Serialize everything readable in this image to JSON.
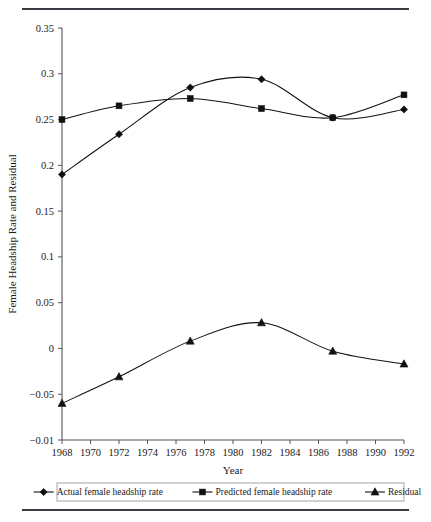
{
  "figure": {
    "top_rule": "horizontal-rule",
    "bottom_rule": "horizontal-rule"
  },
  "chart_data": {
    "type": "line",
    "title": "",
    "xlabel": "Year",
    "ylabel": "Female Headship Rate and Residual",
    "x": [
      1968,
      1972,
      1977,
      1982,
      1987,
      1992
    ],
    "xlim": [
      1968,
      1992
    ],
    "ylim": [
      -0.1,
      0.35
    ],
    "grid": false,
    "legend_position": "bottom",
    "xticks": [
      1968,
      1970,
      1972,
      1974,
      1976,
      1978,
      1980,
      1982,
      1984,
      1986,
      1988,
      1990,
      1992
    ],
    "xticklabels": [
      "1968",
      "1970",
      "1972",
      "1974",
      "1976",
      "1978",
      "1980",
      "1982",
      "1984",
      "1986",
      "1988",
      "1990",
      "1992"
    ],
    "yticks": [
      0.35,
      0.3,
      0.25,
      0.2,
      0.15,
      0.1,
      0.05,
      0,
      -0.05,
      -0.1
    ],
    "yticklabels": [
      "0.35",
      "0.3",
      "0.25",
      "0.2",
      "0.15",
      "0.1",
      "0.05",
      "0",
      "-0.05",
      "-0.01"
    ],
    "series": [
      {
        "name": "Actual female headship rate",
        "marker": "diamond",
        "values": [
          0.19,
          0.234,
          0.285,
          0.294,
          0.252,
          0.261
        ]
      },
      {
        "name": "Predicted female headship rate",
        "marker": "square",
        "values": [
          0.25,
          0.265,
          0.273,
          0.262,
          0.252,
          0.277
        ]
      },
      {
        "name": "Residual",
        "marker": "triangle",
        "values": [
          -0.06,
          -0.031,
          0.008,
          0.028,
          -0.003,
          -0.017
        ]
      }
    ],
    "colors": {
      "line": "#111111",
      "axis": "#55555c",
      "rule": "#3a3a42"
    }
  }
}
